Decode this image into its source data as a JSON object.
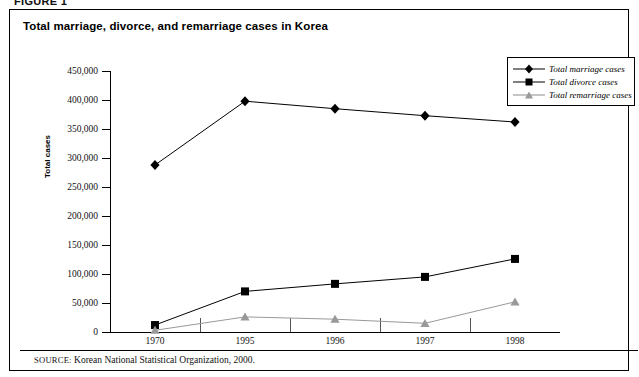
{
  "figure": {
    "label": "FIGURE 1",
    "title": "Total marriage, divorce, and remarriage cases in Korea",
    "source_label": "SOURCE:",
    "source_text": "Korean National Statistical Organization, 2000."
  },
  "chart_data": {
    "type": "line",
    "title": "Total marriage, divorce, and remarriage cases in Korea",
    "xlabel": "",
    "ylabel": "Total cases",
    "categories": [
      "1970",
      "1995",
      "1996",
      "1997",
      "1998"
    ],
    "ylim": [
      0,
      450000
    ],
    "ytick_values": [
      0,
      50000,
      100000,
      150000,
      200000,
      250000,
      300000,
      350000,
      400000,
      450000
    ],
    "ytick_labels": [
      "0",
      "50,000",
      "100,000",
      "150,000",
      "200,000",
      "250,000",
      "300,000",
      "350,000",
      "400,000",
      "450,000"
    ],
    "grid": false,
    "legend_position": "top-right",
    "series": [
      {
        "name": "Total marriage cases",
        "marker": "diamond",
        "color": "#000000",
        "values": [
          288000,
          398000,
          385000,
          373000,
          362000
        ]
      },
      {
        "name": "Total divorce cases",
        "marker": "square",
        "color": "#000000",
        "values": [
          12000,
          70000,
          83000,
          95000,
          126000
        ]
      },
      {
        "name": "Total remarriage cases",
        "marker": "triangle",
        "color": "#999999",
        "values": [
          3000,
          26000,
          22000,
          15000,
          52000
        ]
      }
    ]
  },
  "legend": {
    "items": [
      {
        "label": "Total marriage cases",
        "marker": "diamond-marker-icon"
      },
      {
        "label": "Total divorce cases",
        "marker": "square-marker-icon"
      },
      {
        "label": "Total remarriage cases",
        "marker": "triangle-marker-icon"
      }
    ]
  }
}
